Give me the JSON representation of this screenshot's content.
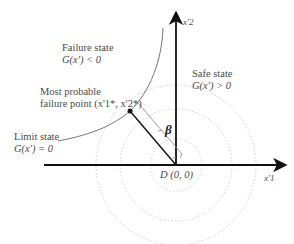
{
  "diagram": {
    "type": "reliability-index-geometry",
    "axes": {
      "x_label": "x'1",
      "y_label": "x'2",
      "origin_label": "D (0, 0)"
    },
    "regions": {
      "failure": {
        "title": "Failure state",
        "condition": "G(x') < 0"
      },
      "safe": {
        "title": "Safe state",
        "condition": "G(x') > 0"
      },
      "limit": {
        "title": "Limit state",
        "condition": "G(x') = 0"
      }
    },
    "point": {
      "title_line1": "Most probable",
      "title_line2": "failure point (x'1*, x'2*)"
    },
    "distance_symbol": "β",
    "contours": {
      "count": 3,
      "style": "dotted",
      "color": "#cccccc"
    },
    "colors": {
      "axis": "#111111",
      "curve": "#777777",
      "text": "#4a4a4a"
    }
  }
}
